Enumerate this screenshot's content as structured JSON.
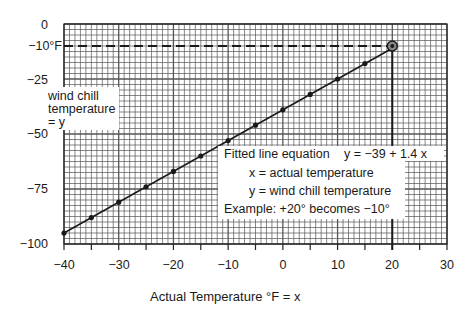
{
  "chart_data": {
    "type": "line",
    "title": "",
    "xlabel": "Actual Temperature °F = x",
    "ylabel": "wind chill temperature = y",
    "xlim": [
      -40,
      30
    ],
    "ylim": [
      -100,
      0
    ],
    "grid": true,
    "x_ticks": [
      "-40",
      "-30",
      "-20",
      "-10",
      "0",
      "10",
      "20",
      "30"
    ],
    "x_tick_values": [
      -40,
      -30,
      -20,
      -10,
      0,
      10,
      20,
      30
    ],
    "y_ticks": [
      "0",
      "-10°F",
      "-25",
      "-50",
      "-75",
      "-100"
    ],
    "y_tick_values": [
      0,
      -10,
      -25,
      -50,
      -75,
      -100
    ],
    "series": [
      {
        "name": "Wind chill data points",
        "x": [
          -40,
          -35,
          -30,
          -25,
          -20,
          -15,
          -10,
          -5,
          0,
          5,
          10,
          15,
          20
        ],
        "values": [
          -95,
          -88,
          -81,
          -74,
          -67,
          -60,
          -53,
          -46,
          -39,
          -32,
          -25,
          -18,
          -11
        ]
      }
    ],
    "fitted_line": {
      "intercept": -39,
      "slope": 1.4,
      "x_start": -40,
      "x_end": 20
    },
    "highlight_point": {
      "x": 20,
      "y": -10
    },
    "annotations": {
      "left_label": [
        "wind chill",
        "temperature",
        "= y"
      ],
      "equation_title": "Fitted line equation",
      "equation": "y =  −39  +  1.4 x",
      "x_def": "x  =  actual temperature",
      "y_def": "y  =  wind chill temperature",
      "example": "Example:  +20° becomes  −10°"
    }
  },
  "labels": {
    "y": {
      "t0": "0",
      "t10": "−10°F",
      "t25": "−25",
      "t50": "−50",
      "t75": "−75",
      "t100": "−100"
    },
    "x": {
      "m40": "−40",
      "m30": "−30",
      "m20": "−20",
      "m10": "−10",
      "z0": "0",
      "p10": "10",
      "p20": "20",
      "p30": "30"
    },
    "xlabel": "Actual Temperature °F = x",
    "left_box": {
      "line1": "wind chill",
      "line2": "temperature",
      "line3": "=  y"
    },
    "eq_box": {
      "title": "Fitted line equation",
      "equation": "y =  −39  +  1.4 x",
      "xdef": "x  =  actual temperature",
      "ydef": "y  =  wind chill temperature",
      "example": "Example:  +20° becomes  −10°"
    }
  },
  "colors": {
    "grid": "#555555",
    "line": "#1a1a1a",
    "background": "#ffffff"
  }
}
